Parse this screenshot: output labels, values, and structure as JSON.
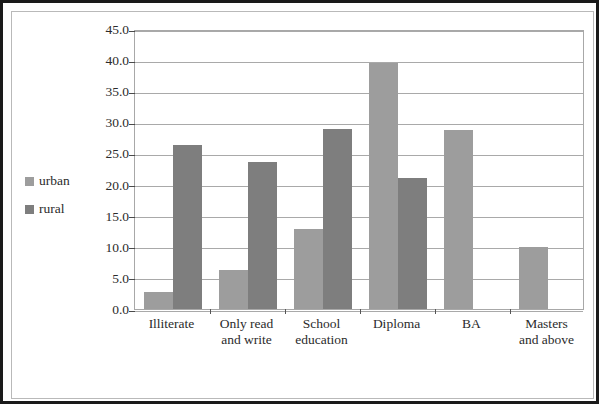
{
  "legend": {
    "position": "left-middle",
    "entries": [
      {
        "label": "urban",
        "color": "#9d9d9d"
      },
      {
        "label": "rural",
        "color": "#7e7e7e"
      }
    ]
  },
  "axis": {
    "y_ticks": [
      "0.0",
      "5.0",
      "10.0",
      "15.0",
      "20.0",
      "25.0",
      "30.0",
      "35.0",
      "40.0",
      "45.0"
    ]
  },
  "chart_data": {
    "type": "bar",
    "title": "",
    "xlabel": "",
    "ylabel": "",
    "ylim": [
      0,
      45
    ],
    "ytick_step": 5,
    "grid": true,
    "legend_position": "left",
    "categories": [
      "Illiterate",
      "Only read and write",
      "School education",
      "Diploma",
      "BA",
      "Masters and above"
    ],
    "category_lines": [
      [
        "Illiterate"
      ],
      [
        "Only read",
        "and write"
      ],
      [
        "School",
        "education"
      ],
      [
        "Diploma"
      ],
      [
        "BA"
      ],
      [
        "Masters",
        "and above"
      ]
    ],
    "series": [
      {
        "name": "urban",
        "color": "#9d9d9d",
        "values": [
          2.8,
          6.3,
          12.8,
          39.5,
          28.7,
          10.0
        ]
      },
      {
        "name": "rural",
        "color": "#7e7e7e",
        "values": [
          26.3,
          23.7,
          29.0,
          21.0,
          0.0,
          0.0
        ]
      }
    ]
  }
}
